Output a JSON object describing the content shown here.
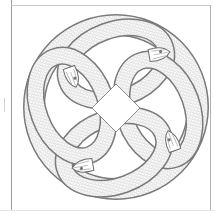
{
  "page": {
    "kind": "coloring-page"
  },
  "illustration": {
    "description": "Four interlaced serpents forming a circular Celtic knot",
    "serpent_count": 4,
    "line_color": "#8a8a8a",
    "background_color": "#ffffff"
  },
  "colors": {
    "frame": "#9a9a9a",
    "scale_stroke": "#9c9c9c",
    "outline": "#7a7a7a"
  }
}
